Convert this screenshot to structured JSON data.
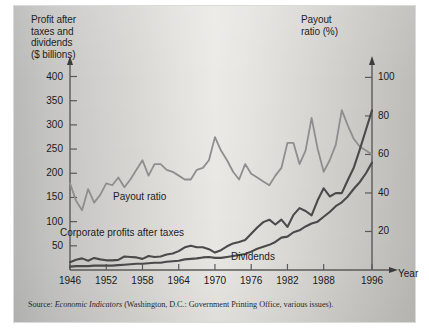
{
  "figure": {
    "left_axis_title": "Profit after\ntaxes and\ndividends\n($ billions)",
    "right_axis_title": "Payout\nratio (%)",
    "x_axis_name": "Year",
    "source_prefix": "Source: ",
    "source_italic": "Economic Indicators",
    "source_rest": " (Washington, D.C.: Government Printing Office, various issues).",
    "label_payout": "Payout ratio",
    "label_profits": "Corporate profits after taxes",
    "label_dividends": "Dividends"
  },
  "colors": {
    "payout_line": "#8e8e8e",
    "profits_line": "#4a4a4a",
    "dividends_line": "#4a4a4a",
    "axis": "#5a5a5a",
    "text": "#1a1a1a",
    "plate_light": "#ecebe8",
    "plate_dark": "#bcbbb8"
  },
  "chart_data": {
    "type": "line",
    "title": "",
    "subtitle": "",
    "xlabel": "Year",
    "ylabel": "Profit after taxes and dividends ($ billions)",
    "y2label": "Payout ratio (%)",
    "grid": false,
    "legend": "inline-annotations",
    "xlim": [
      1946,
      1996
    ],
    "ylim": [
      0,
      430
    ],
    "y2lim": [
      0,
      108
    ],
    "xticks": [
      1946,
      1952,
      1958,
      1964,
      1970,
      1976,
      1982,
      1988,
      1996
    ],
    "yticks": [
      50,
      100,
      150,
      200,
      250,
      300,
      350,
      400
    ],
    "y2ticks": [
      20,
      40,
      60,
      80,
      100
    ],
    "series": [
      {
        "name": "Payout ratio",
        "axis": "right",
        "unit": "%",
        "color": "#8e8e8e",
        "x": [
          1946,
          1947,
          1948,
          1949,
          1950,
          1951,
          1952,
          1953,
          1954,
          1955,
          1956,
          1957,
          1958,
          1959,
          1960,
          1961,
          1962,
          1963,
          1964,
          1965,
          1966,
          1967,
          1968,
          1969,
          1970,
          1971,
          1972,
          1973,
          1974,
          1975,
          1976,
          1977,
          1978,
          1979,
          1980,
          1981,
          1982,
          1983,
          1984,
          1985,
          1986,
          1987,
          1988,
          1989,
          1990,
          1991,
          1992,
          1993,
          1994,
          1995,
          1996
        ],
        "values": [
          45,
          36,
          31,
          42,
          35,
          39,
          45,
          44,
          48,
          43,
          47,
          52,
          57,
          49,
          55,
          55,
          52,
          51,
          49,
          47,
          47,
          52,
          53,
          57,
          69,
          62,
          57,
          51,
          47,
          55,
          50,
          48,
          46,
          44,
          49,
          53,
          66,
          66,
          55,
          62,
          79,
          63,
          51,
          57,
          65,
          83,
          75,
          68,
          64,
          62,
          60
        ]
      },
      {
        "name": "Corporate profits after taxes",
        "axis": "left",
        "unit": "$ billions",
        "color": "#4a4a4a",
        "x": [
          1946,
          1947,
          1948,
          1949,
          1950,
          1951,
          1952,
          1953,
          1954,
          1955,
          1956,
          1957,
          1958,
          1959,
          1960,
          1961,
          1962,
          1963,
          1964,
          1965,
          1966,
          1967,
          1968,
          1969,
          1970,
          1971,
          1972,
          1973,
          1974,
          1975,
          1976,
          1977,
          1978,
          1979,
          1980,
          1981,
          1982,
          1983,
          1984,
          1985,
          1986,
          1987,
          1988,
          1989,
          1990,
          1991,
          1992,
          1993,
          1994,
          1995,
          1996
        ],
        "values": [
          16,
          21,
          24,
          19,
          25,
          22,
          20,
          20,
          21,
          28,
          27,
          26,
          23,
          29,
          27,
          28,
          32,
          34,
          39,
          47,
          50,
          47,
          47,
          43,
          36,
          41,
          49,
          55,
          58,
          62,
          75,
          88,
          99,
          104,
          94,
          104,
          89,
          114,
          128,
          122,
          113,
          144,
          169,
          152,
          159,
          159,
          186,
          212,
          250,
          290,
          330
        ]
      },
      {
        "name": "Dividends",
        "axis": "left",
        "unit": "$ billions",
        "color": "#4a4a4a",
        "x": [
          1946,
          1947,
          1948,
          1949,
          1950,
          1951,
          1952,
          1953,
          1954,
          1955,
          1956,
          1957,
          1958,
          1959,
          1960,
          1961,
          1962,
          1963,
          1964,
          1965,
          1966,
          1967,
          1968,
          1969,
          1970,
          1971,
          1972,
          1973,
          1974,
          1975,
          1976,
          1977,
          1978,
          1979,
          1980,
          1981,
          1982,
          1983,
          1984,
          1985,
          1986,
          1987,
          1988,
          1989,
          1990,
          1991,
          1992,
          1993,
          1994,
          1995,
          1996
        ],
        "values": [
          7,
          8,
          8,
          8,
          9,
          9,
          9,
          9,
          10,
          11,
          12,
          13,
          13,
          14,
          15,
          15,
          17,
          18,
          19,
          22,
          23,
          24,
          26,
          27,
          25,
          25,
          27,
          29,
          31,
          33,
          38,
          44,
          48,
          52,
          58,
          67,
          69,
          78,
          82,
          90,
          96,
          100,
          110,
          120,
          132,
          140,
          152,
          168,
          182,
          200,
          222
        ]
      }
    ]
  }
}
